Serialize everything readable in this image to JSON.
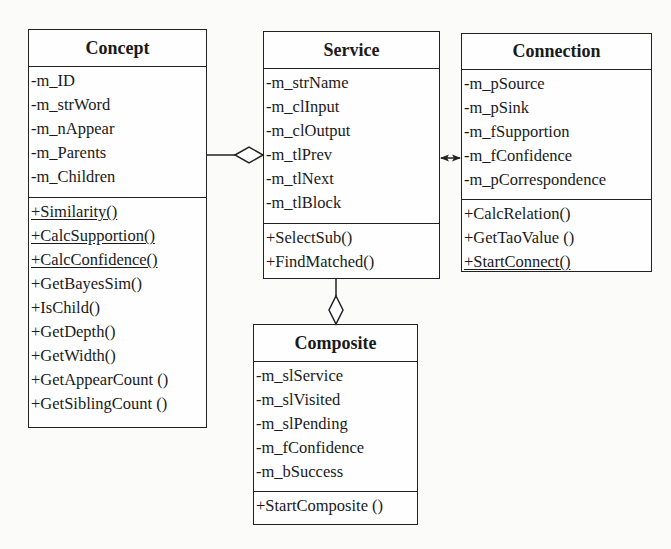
{
  "diagram": {
    "type": "uml-class-diagram",
    "classes": [
      {
        "name": "Concept",
        "attributes": [
          "-m_ID",
          "-m_strWord",
          "-m_nAppear",
          "-m_Parents",
          "-m_Children"
        ],
        "methods": [
          {
            "label": "+Similarity()",
            "static": true
          },
          {
            "label": "+CalcSupportion()",
            "static": true
          },
          {
            "label": "+CalcConfidence()",
            "static": true
          },
          {
            "label": "+GetBayesSim()",
            "static": false
          },
          {
            "label": "+IsChild()",
            "static": false
          },
          {
            "label": "+GetDepth()",
            "static": false
          },
          {
            "label": "+GetWidth()",
            "static": false
          },
          {
            "label": "+GetAppearCount ()",
            "static": false
          },
          {
            "label": "+GetSiblingCount ()",
            "static": false
          }
        ]
      },
      {
        "name": "Service",
        "attributes": [
          "-m_strName",
          "-m_clInput",
          "-m_clOutput",
          "-m_tlPrev",
          "-m_tlNext",
          "-m_tlBlock"
        ],
        "methods": [
          {
            "label": "+SelectSub()",
            "static": false
          },
          {
            "label": "+FindMatched()",
            "static": false
          }
        ]
      },
      {
        "name": "Connection",
        "attributes": [
          "-m_pSource",
          "-m_pSink",
          "-m_fSupportion",
          "-m_fConfidence",
          "-m_pCorrespondence"
        ],
        "methods": [
          {
            "label": "+CalcRelation()",
            "static": false
          },
          {
            "label": "+GetTaoValue ()",
            "static": false
          },
          {
            "label": "+StartConnect()",
            "static": true
          }
        ]
      },
      {
        "name": "Composite",
        "attributes": [
          "-m_slService",
          "-m_slVisited",
          "-m_slPending",
          "-m_fConfidence",
          "-m_bSuccess"
        ],
        "methods": [
          {
            "label": "+StartComposite ()",
            "static": false
          }
        ]
      }
    ],
    "relationships": [
      {
        "from": "Concept",
        "to": "Service",
        "kind": "aggregation",
        "diamond_at": "Service"
      },
      {
        "from": "Service",
        "to": "Connection",
        "kind": "bidirectional-association"
      },
      {
        "from": "Composite",
        "to": "Service",
        "kind": "aggregation",
        "diamond_at": "Composite"
      }
    ]
  }
}
